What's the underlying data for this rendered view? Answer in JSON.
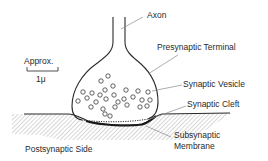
{
  "figure": {
    "type": "synapse-diagram",
    "labels": {
      "axon": "Axon",
      "presynaptic_terminal": "Presynaptic Terminal",
      "synaptic_vesicle": "Synaptic Vesicle",
      "synaptic_cleft": "Synaptic Cleft",
      "subsynaptic_membrane_line1": "Subsynaptic",
      "subsynaptic_membrane_line2": "Membrane",
      "postsynaptic_side": "Postsynaptic Side"
    },
    "scale_bar": {
      "caption": "Approx.",
      "value": "1μ"
    },
    "colors": {
      "line": "#2a2a2a",
      "leader": "#8a8a8a",
      "hatch": "#9a9a9a",
      "background": "#ffffff"
    }
  }
}
